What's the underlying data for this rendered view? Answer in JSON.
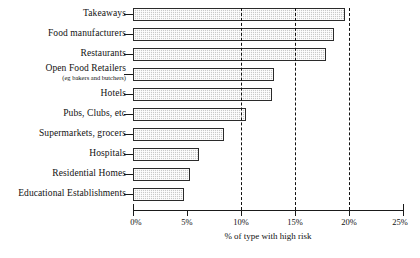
{
  "chart_data": {
    "type": "bar",
    "orientation": "horizontal",
    "title": "",
    "xlabel": "% of type with high risk",
    "ylabel": "",
    "xlim": [
      0,
      25
    ],
    "grid": false,
    "legend": null,
    "xticks": [
      "0%",
      "5%",
      "10%",
      "15%",
      "20%",
      "25%"
    ],
    "xtick_values": [
      0,
      5,
      10,
      15,
      20,
      25
    ],
    "reference_lines": [
      10,
      15,
      20
    ],
    "categories": [
      "Takeaways",
      "Food manufacturers",
      "Restaurants",
      "Open Food Retailers",
      "Hotels",
      "Pubs, Clubs, etc",
      "Supermarkets, grocers",
      "Hospitals",
      "Residential Homes",
      "Educational Establishments"
    ],
    "category_sublabels": [
      "",
      "",
      "",
      "(eg bakers and butchers)",
      "",
      "",
      "",
      "",
      "",
      ""
    ],
    "values": [
      19.6,
      18.6,
      17.9,
      13.1,
      12.9,
      10.5,
      8.4,
      6.1,
      5.3,
      4.7
    ]
  },
  "style": {
    "bar_fill": "#c9c9c9",
    "bar_edge": "#2b2b2b",
    "axis_color": "#1a1a1a",
    "background": "#ffffff"
  }
}
